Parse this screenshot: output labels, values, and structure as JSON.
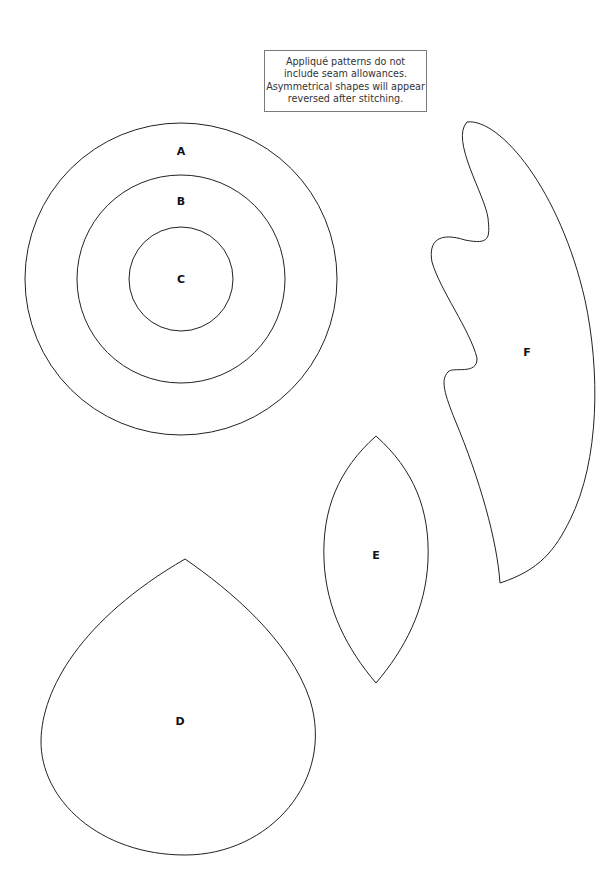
{
  "note": {
    "lines": [
      "Appliqué patterns do not",
      "include seam allowances.",
      "Asymmetrical shapes will appear",
      "reversed after stitching."
    ]
  },
  "shapes": {
    "A": {
      "label": "A",
      "type": "circle"
    },
    "B": {
      "label": "B",
      "type": "circle"
    },
    "C": {
      "label": "C",
      "type": "circle"
    },
    "D": {
      "label": "D",
      "type": "teardrop"
    },
    "E": {
      "label": "E",
      "type": "leaf"
    },
    "F": {
      "label": "F",
      "type": "flame"
    }
  },
  "colors": {
    "outline": "#222222",
    "background": "#ffffff",
    "note_border": "#7a7a7a"
  }
}
